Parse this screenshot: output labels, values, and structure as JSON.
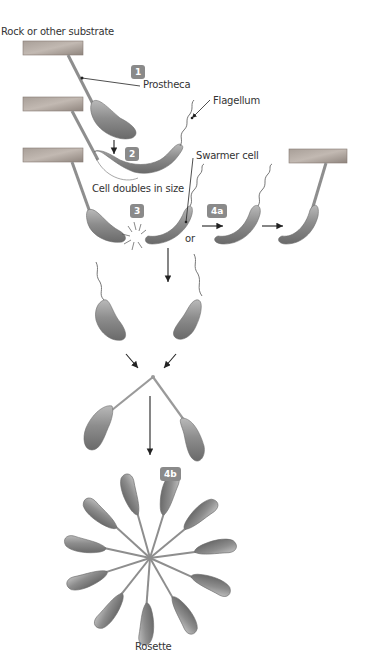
{
  "labels": {
    "substrate": "Rock or other substrate",
    "prostheca": "Prostheca",
    "flagellum": "Flagellum",
    "swarmer": "Swarmer cell",
    "doubles": "Cell doubles in size",
    "or": "or",
    "rosette": "Rosette"
  },
  "steps": {
    "s1": "1",
    "s2": "2",
    "s3": "3",
    "s4a": "4a",
    "s4b": "4b"
  },
  "colors": {
    "cell": "#8c8c8c",
    "cell_highlight": "#c4c4c4",
    "substrate": "#9a8f88",
    "badge": "#8a8a8a",
    "arrow": "#222222",
    "text": "#333333"
  }
}
